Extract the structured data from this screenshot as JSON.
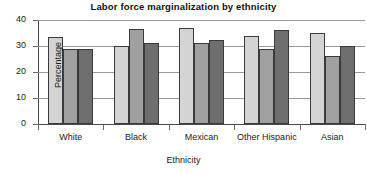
{
  "chart_data": {
    "type": "bar",
    "title": "Labor force marginalization by ethnicity",
    "xlabel": "Ethnicity",
    "ylabel": "Percentage",
    "categories": [
      "White",
      "Black",
      "Mexican",
      "Other Hispanic",
      "Asian"
    ],
    "ylim": [
      0,
      40
    ],
    "yticks": [
      0,
      10,
      20,
      30,
      40
    ],
    "ytick_labels": [
      "0",
      "10",
      "20",
      "30",
      "40"
    ],
    "grid": true,
    "legend": "none",
    "series": [
      {
        "name": "series-1",
        "color": "#d4d4d4",
        "values": [
          33.5,
          30.0,
          37.0,
          34.0,
          35.0
        ]
      },
      {
        "name": "series-2",
        "color": "#a0a0a0",
        "values": [
          29.0,
          36.5,
          31.0,
          28.7,
          26.0
        ]
      },
      {
        "name": "series-3",
        "color": "#6e6e6e",
        "values": [
          29.0,
          31.0,
          32.5,
          36.0,
          30.0
        ]
      }
    ]
  }
}
